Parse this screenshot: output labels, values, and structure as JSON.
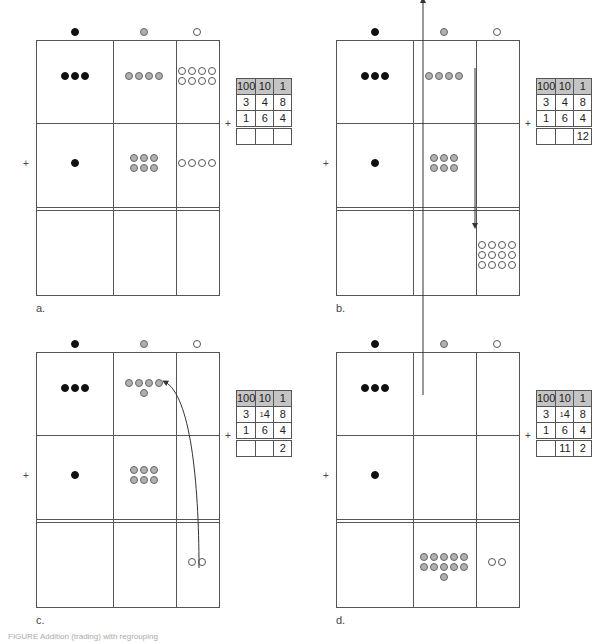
{
  "figure": {
    "caption": "FIGURE  Addition (trading) with regrouping",
    "column_markers": [
      {
        "name": "hundreds-marker",
        "color": "black"
      },
      {
        "name": "tens-marker",
        "color": "gray"
      },
      {
        "name": "ones-marker",
        "color": "white"
      }
    ],
    "panels": [
      {
        "id": "a",
        "label": "a.",
        "table": {
          "headers": [
            "100",
            "10",
            "1"
          ],
          "rows": [
            [
              "3",
              "4",
              "8"
            ],
            [
              "1",
              "6",
              "4"
            ]
          ],
          "sum": [
            "",
            "",
            ""
          ],
          "carry_tens": ""
        },
        "counts": {
          "row1": {
            "hundreds": 3,
            "tens": 4,
            "ones": 8
          },
          "row2": {
            "hundreds": 1,
            "tens": 6,
            "ones": 4
          },
          "result": {
            "hundreds": 0,
            "tens": 0,
            "ones": 0
          }
        }
      },
      {
        "id": "b",
        "label": "b.",
        "table": {
          "headers": [
            "100",
            "10",
            "1"
          ],
          "rows": [
            [
              "3",
              "4",
              "8"
            ],
            [
              "1",
              "6",
              "4"
            ]
          ],
          "sum": [
            "",
            "",
            "12"
          ],
          "carry_tens": ""
        },
        "counts": {
          "row1": {
            "hundreds": 3,
            "tens": 4,
            "ones": 0
          },
          "row2": {
            "hundreds": 1,
            "tens": 6,
            "ones": 0
          },
          "result": {
            "hundreds": 0,
            "tens": 0,
            "ones": 12
          }
        }
      },
      {
        "id": "c",
        "label": "c.",
        "table": {
          "headers": [
            "100",
            "10",
            "1"
          ],
          "rows": [
            [
              "3",
              "4",
              "8"
            ],
            [
              "1",
              "6",
              "4"
            ]
          ],
          "sum": [
            "",
            "",
            "2"
          ],
          "carry_tens": "1"
        },
        "counts": {
          "row1": {
            "hundreds": 3,
            "tens": 5,
            "ones": 0
          },
          "row2": {
            "hundreds": 1,
            "tens": 6,
            "ones": 0
          },
          "result": {
            "hundreds": 0,
            "tens": 0,
            "ones": 2
          }
        }
      },
      {
        "id": "d",
        "label": "d.",
        "table": {
          "headers": [
            "100",
            "10",
            "1"
          ],
          "rows": [
            [
              "3",
              "4",
              "8"
            ],
            [
              "1",
              "6",
              "4"
            ]
          ],
          "sum": [
            "",
            "11",
            "2"
          ],
          "carry_tens": "1"
        },
        "counts": {
          "row1": {
            "hundreds": 3,
            "tens": 0,
            "ones": 0
          },
          "row2": {
            "hundreds": 1,
            "tens": 0,
            "ones": 0
          },
          "result": {
            "hundreds": 0,
            "tens": 11,
            "ones": 2
          }
        }
      }
    ],
    "plus_sign": "+"
  }
}
